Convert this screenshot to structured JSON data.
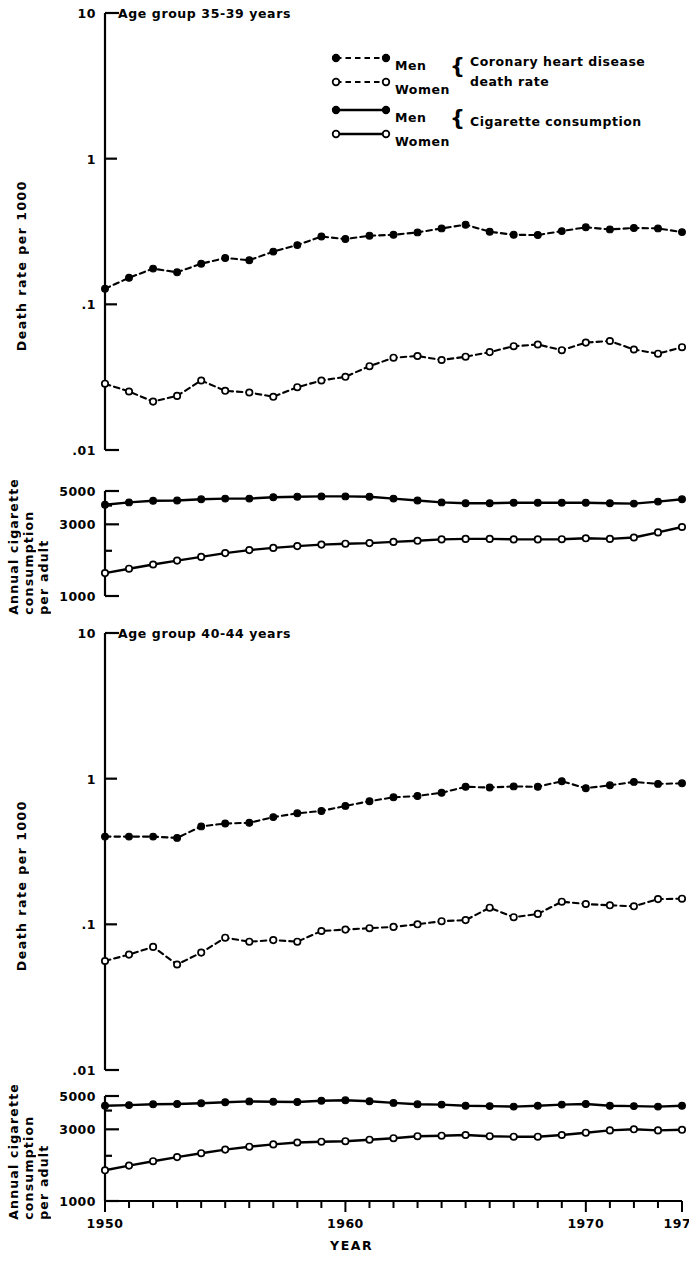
{
  "figure": {
    "xlabel": "YEAR",
    "x_tick_labels": [
      "1950",
      "1960",
      "1970",
      "1974"
    ],
    "x_tick_years": [
      1950,
      1960,
      1970,
      1974
    ]
  },
  "legend": {
    "items": [
      {
        "label": "Men",
        "style": "dashed",
        "marker": "filled"
      },
      {
        "label": "Women",
        "style": "dashed",
        "marker": "open"
      },
      {
        "label": "Men",
        "style": "solid",
        "marker": "filled"
      },
      {
        "label": "Women",
        "style": "solid",
        "marker": "open"
      }
    ],
    "group_1_line_1": "Coronary heart disease",
    "group_1_line_2": "death rate",
    "group_2": "Cigarette consumption"
  },
  "panels": {
    "top_death": {
      "title": "Age group 35-39 years",
      "ylabel": "Death rate per 1000",
      "y_tick_labels": [
        "10",
        "1",
        ".1",
        ".01"
      ]
    },
    "top_cig": {
      "ylabel_lines": [
        "Annual cigarette",
        "consumption",
        "per adult"
      ],
      "y_tick_labels": [
        "5000",
        "3000",
        "1000"
      ]
    },
    "bottom_death": {
      "title": "Age group 40-44 years",
      "ylabel": "Death rate per 1000",
      "y_tick_labels": [
        "10",
        "1",
        ".1",
        ".01"
      ]
    },
    "bottom_cig": {
      "ylabel_lines": [
        "Annual cigarette",
        "consumption",
        "per adult"
      ],
      "y_tick_labels": [
        "5000",
        "3000",
        "1000"
      ]
    }
  },
  "chart_data": [
    {
      "id": "chd_35_39",
      "type": "line",
      "title": "Age group 35-39 years",
      "xlabel": "YEAR",
      "ylabel": "Death rate per 1000",
      "yscale": "log",
      "ylim": [
        0.01,
        10
      ],
      "xlim": [
        1950,
        1974
      ],
      "grid": false,
      "legend": "top-right",
      "x": [
        1950,
        1951,
        1952,
        1953,
        1954,
        1955,
        1956,
        1957,
        1958,
        1959,
        1960,
        1961,
        1962,
        1963,
        1964,
        1965,
        1966,
        1967,
        1968,
        1969,
        1970,
        1971,
        1972,
        1973,
        1974
      ],
      "series": [
        {
          "name": "Men",
          "marker": "filled",
          "style": "dashed",
          "values": [
            0.128,
            0.152,
            0.176,
            0.166,
            0.19,
            0.208,
            0.201,
            0.23,
            0.255,
            0.292,
            0.281,
            0.296,
            0.3,
            0.312,
            0.332,
            0.352,
            0.315,
            0.3,
            0.299,
            0.318,
            0.338,
            0.327,
            0.334,
            0.332,
            0.313
          ]
        },
        {
          "name": "Women",
          "marker": "open",
          "style": "dashed",
          "values": [
            0.0285,
            0.0252,
            0.0215,
            0.0235,
            0.03,
            0.0255,
            0.0248,
            0.0232,
            0.027,
            0.03,
            0.0318,
            0.0376,
            0.043,
            0.0442,
            0.0415,
            0.0437,
            0.047,
            0.0516,
            0.053,
            0.0484,
            0.0546,
            0.056,
            0.049,
            0.0458,
            0.0508
          ]
        }
      ]
    },
    {
      "id": "cig_35_39",
      "type": "line",
      "ylabel": "Annual cigarette consumption per adult",
      "yscale": "log",
      "ylim": [
        1000,
        5000
      ],
      "xlim": [
        1950,
        1974
      ],
      "grid": false,
      "x": [
        1950,
        1951,
        1952,
        1953,
        1954,
        1955,
        1956,
        1957,
        1958,
        1959,
        1960,
        1961,
        1962,
        1963,
        1964,
        1965,
        1966,
        1967,
        1968,
        1969,
        1970,
        1971,
        1972,
        1973,
        1974
      ],
      "series": [
        {
          "name": "Men",
          "marker": "filled",
          "style": "solid",
          "values": [
            4050,
            4200,
            4300,
            4320,
            4400,
            4450,
            4450,
            4550,
            4580,
            4600,
            4600,
            4580,
            4450,
            4320,
            4200,
            4150,
            4150,
            4180,
            4180,
            4180,
            4180,
            4150,
            4120,
            4250,
            4400
          ]
        },
        {
          "name": "Women",
          "marker": "open",
          "style": "solid",
          "values": [
            1420,
            1520,
            1620,
            1720,
            1820,
            1930,
            2020,
            2090,
            2150,
            2200,
            2230,
            2250,
            2290,
            2330,
            2380,
            2400,
            2400,
            2380,
            2380,
            2390,
            2420,
            2400,
            2450,
            2650,
            2880
          ]
        }
      ]
    },
    {
      "id": "chd_40_44",
      "type": "line",
      "title": "Age group 40-44 years",
      "xlabel": "YEAR",
      "ylabel": "Death rate per 1000",
      "yscale": "log",
      "ylim": [
        0.01,
        10
      ],
      "xlim": [
        1950,
        1974
      ],
      "grid": false,
      "x": [
        1950,
        1951,
        1952,
        1953,
        1954,
        1955,
        1956,
        1957,
        1958,
        1959,
        1960,
        1961,
        1962,
        1963,
        1964,
        1965,
        1966,
        1967,
        1968,
        1969,
        1970,
        1971,
        1972,
        1973,
        1974
      ],
      "series": [
        {
          "name": "Men",
          "marker": "filled",
          "style": "dashed",
          "values": [
            0.4,
            0.4,
            0.4,
            0.392,
            0.47,
            0.492,
            0.498,
            0.545,
            0.578,
            0.6,
            0.65,
            0.7,
            0.745,
            0.76,
            0.8,
            0.88,
            0.87,
            0.885,
            0.88,
            0.96,
            0.86,
            0.9,
            0.95,
            0.92,
            0.93
          ]
        },
        {
          "name": "Women",
          "marker": "open",
          "style": "dashed",
          "values": [
            0.056,
            0.062,
            0.07,
            0.053,
            0.064,
            0.081,
            0.076,
            0.078,
            0.076,
            0.09,
            0.092,
            0.094,
            0.096,
            0.1,
            0.105,
            0.107,
            0.13,
            0.112,
            0.118,
            0.143,
            0.138,
            0.135,
            0.133,
            0.149,
            0.15
          ]
        }
      ]
    },
    {
      "id": "cig_40_44",
      "type": "line",
      "ylabel": "Annual cigarette consumption per adult",
      "yscale": "log",
      "ylim": [
        1000,
        5000
      ],
      "xlim": [
        1950,
        1974
      ],
      "grid": false,
      "x": [
        1950,
        1951,
        1952,
        1953,
        1954,
        1955,
        1956,
        1957,
        1958,
        1959,
        1960,
        1961,
        1962,
        1963,
        1964,
        1965,
        1966,
        1967,
        1968,
        1969,
        1970,
        1971,
        1972,
        1973,
        1974
      ],
      "series": [
        {
          "name": "Men",
          "marker": "filled",
          "style": "solid",
          "values": [
            4300,
            4350,
            4400,
            4420,
            4470,
            4550,
            4600,
            4580,
            4560,
            4650,
            4680,
            4620,
            4500,
            4400,
            4380,
            4300,
            4280,
            4250,
            4300,
            4380,
            4420,
            4300,
            4280,
            4250,
            4300
          ]
        },
        {
          "name": "Women",
          "marker": "open",
          "style": "solid",
          "values": [
            1600,
            1720,
            1840,
            1960,
            2080,
            2200,
            2300,
            2380,
            2450,
            2480,
            2500,
            2560,
            2620,
            2700,
            2720,
            2750,
            2700,
            2680,
            2680,
            2750,
            2850,
            2950,
            3000,
            2950,
            2980
          ]
        }
      ]
    }
  ]
}
